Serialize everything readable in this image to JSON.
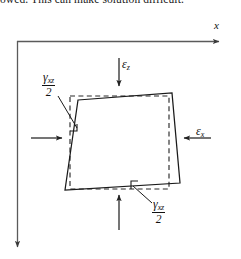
{
  "page": {
    "caption_text": "owed. This can make solution difficult.",
    "background_color": "#ffffff",
    "ink_color": "#111111",
    "width": 241,
    "height": 259
  },
  "figure": {
    "axes": {
      "x_label": "x",
      "z_label": "z",
      "x_axis_direction": "right",
      "z_axis_direction": "down"
    },
    "labels": {
      "strain_z": {
        "symbol": "ε",
        "subscript": "z"
      },
      "strain_x": {
        "symbol": "ε",
        "subscript": "x"
      },
      "shear_upper_left": {
        "symbol": "γ",
        "subscript": "xz",
        "denominator": "2"
      },
      "shear_lower_right": {
        "symbol": "γ",
        "subscript": "xz",
        "denominator": "2"
      }
    },
    "shapes": {
      "reference_square": "dashed",
      "deformed_element": "solid-parallelogram"
    },
    "arrows": [
      {
        "name": "epsilon-z-top-arrow",
        "direction": "down"
      },
      {
        "name": "epsilon-z-bottom-arrow",
        "direction": "up"
      },
      {
        "name": "epsilon-x-right-arrow",
        "direction": "left"
      },
      {
        "name": "epsilon-x-left-arrow",
        "direction": "right"
      }
    ]
  }
}
